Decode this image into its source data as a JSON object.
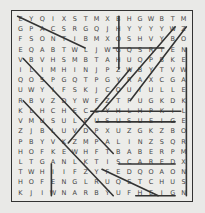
{
  "puzzle": {
    "title": "Word search",
    "cols": 16,
    "rows": [
      "EYQIXSTMXBHGWBTM",
      "GPACSRGQJHYYYYWZ",
      "FSONTIBMXOSHVYBO",
      "EQABTWLJWGQSRTEN",
      "VBVHSMBTAHUQPBKE",
      "ILIMHINJPZWBYTVW",
      "QOSPGQTPGYRAXCGA",
      "UWYIFSKJCOUIULLE",
      "RBVZDYWFZTFUGKDK",
      "KLHCHECCYHLHPKIL",
      "VMUSULFUSUSUEIGE",
      "ZJBLUVDPXUZGKZBO",
      "PBYVKZMPALINZSQR",
      "HOFKEWHFTBABERPM",
      "LTGANLKTISCAREDX",
      "TWHIIFZYFEDQOAON",
      "HOFENGLRUQETCHUS",
      "KJIWNARBYUFHEIGN"
    ],
    "extra_rows": [
      "KDOJEPNGSBJPMSBC",
      "ISATGEPSBEFAIXJB"
    ],
    "found_lines": [
      {
        "x1": 9.5,
        "y1": 0.5,
        "x2": 9.5,
        "y2": 5.5
      },
      {
        "x1": 15.5,
        "y1": 3.5,
        "x2": 15.5,
        "y2": 17.5
      },
      {
        "x1": 1,
        "y1": 4.5,
        "x2": 9,
        "y2": 13.5
      },
      {
        "x1": 6.5,
        "y1": 3.5,
        "x2": 0.5,
        "y2": 0.5
      },
      {
        "x1": 9,
        "y1": 3.5,
        "x2": 13.5,
        "y2": 3.5
      },
      {
        "x1": 7,
        "y1": 9.5,
        "x2": 15,
        "y2": 9.5
      },
      {
        "x1": 7.5,
        "y1": 10.5,
        "x2": 14.5,
        "y2": 10.5
      },
      {
        "x1": 9.5,
        "y1": 14.5,
        "x2": 14.5,
        "y2": 14.5
      },
      {
        "x1": 1,
        "y1": 8.5,
        "x2": 9,
        "y2": 17.5
      },
      {
        "x1": 5,
        "y1": 12.5,
        "x2": 10.5,
        "y2": 5.5
      },
      {
        "x1": 8,
        "y1": 9.5,
        "x2": 14.5,
        "y2": 1.5
      },
      {
        "x1": 10.5,
        "y1": 8.5,
        "x2": 15.5,
        "y2": 1.5
      },
      {
        "x1": 3.5,
        "y1": 14.5,
        "x2": 3.5,
        "y2": 17.5
      },
      {
        "x1": 8,
        "y1": 15,
        "x2": 13,
        "y2": 17.5
      },
      {
        "x1": 11,
        "y1": 17.5,
        "x2": 14.5,
        "y2": 17.5
      }
    ],
    "colors": {
      "background": "#e9e9e7",
      "ink": "#444444",
      "line": "#333333"
    }
  }
}
